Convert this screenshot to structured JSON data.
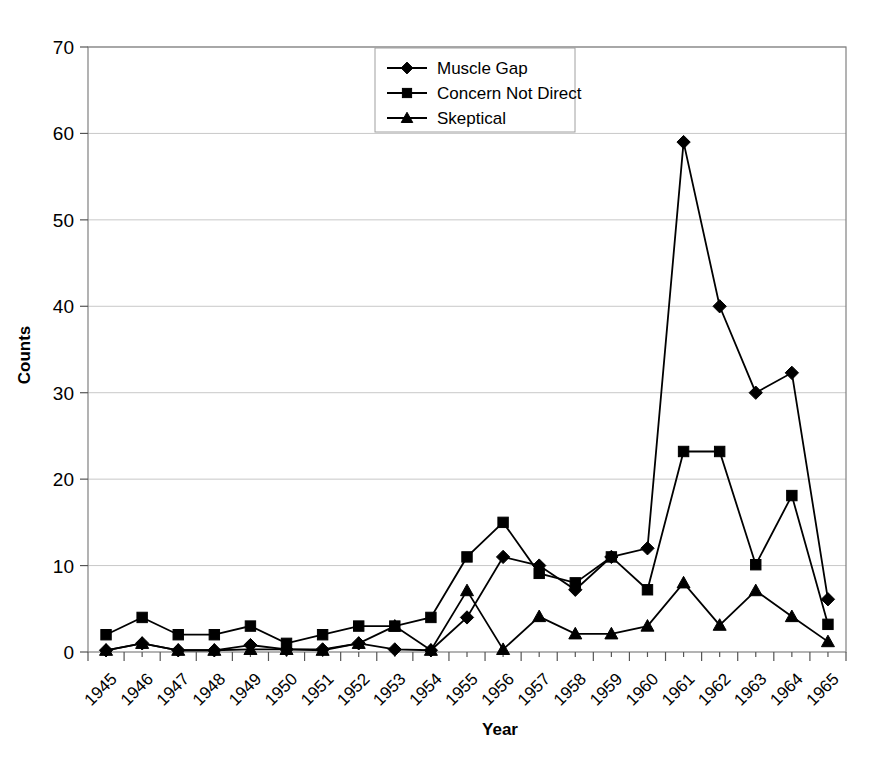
{
  "chart_data": {
    "type": "line",
    "title": "",
    "xlabel": "Year",
    "ylabel": "Counts",
    "ylim": [
      0,
      70
    ],
    "ytick_step": 10,
    "yticks": [
      0,
      10,
      20,
      30,
      40,
      50,
      60,
      70
    ],
    "grid": true,
    "grid_axis": "y",
    "legend_position": "top-center",
    "categories": [
      "1945",
      "1946",
      "1947",
      "1948",
      "1949",
      "1950",
      "1951",
      "1952",
      "1953",
      "1954",
      "1955",
      "1956",
      "1957",
      "1958",
      "1959",
      "1960",
      "1961",
      "1962",
      "1963",
      "1964",
      "1965"
    ],
    "series": [
      {
        "name": "Muscle Gap",
        "marker": "diamond",
        "values": [
          0.2,
          1.0,
          0.2,
          0.2,
          0.8,
          0.3,
          0.3,
          1.0,
          0.3,
          0.2,
          4.0,
          11.0,
          10.0,
          7.2,
          11.0,
          12.0,
          59.0,
          40.0,
          30.0,
          32.3,
          6.1
        ]
      },
      {
        "name": "Concern Not Direct",
        "marker": "square",
        "values": [
          2.0,
          4.0,
          2.0,
          2.0,
          3.0,
          1.0,
          2.0,
          3.0,
          3.0,
          4.0,
          11.0,
          15.0,
          9.1,
          8.0,
          11.0,
          7.2,
          23.2,
          23.2,
          10.1,
          18.1,
          3.2
        ]
      },
      {
        "name": "Skeptical",
        "marker": "triangle",
        "values": [
          0.2,
          1.0,
          0.2,
          0.2,
          0.3,
          0.3,
          0.2,
          1.0,
          3.0,
          0.2,
          7.1,
          0.3,
          4.1,
          2.1,
          2.1,
          3.0,
          8.0,
          3.1,
          7.1,
          4.1,
          1.2
        ]
      }
    ],
    "colors": {
      "series": "#000000",
      "grid": "#c8c8c8",
      "axis": "#555555",
      "background": "#ffffff"
    }
  },
  "legend": {
    "items": [
      {
        "label": "Muscle Gap",
        "marker": "diamond"
      },
      {
        "label": "Concern Not Direct",
        "marker": "square"
      },
      {
        "label": "Skeptical",
        "marker": "triangle"
      }
    ]
  },
  "axes": {
    "y_title": "Counts",
    "x_title": "Year"
  }
}
